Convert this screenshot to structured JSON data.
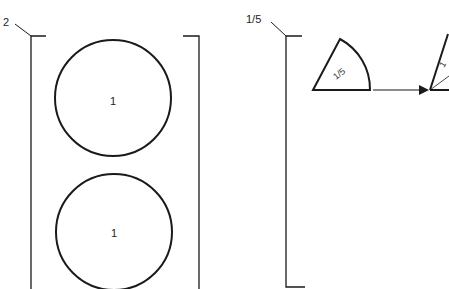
{
  "figure": {
    "left_group": {
      "reference_label": "2",
      "items": [
        {
          "shape": "circle",
          "label": "1"
        },
        {
          "shape": "circle",
          "label": "1"
        }
      ]
    },
    "right_group": {
      "reference_label": "1/5",
      "sector": {
        "label": "1/5"
      },
      "arrow": "arrow-right",
      "partial_sector_label": "1"
    }
  }
}
